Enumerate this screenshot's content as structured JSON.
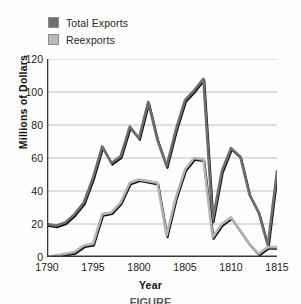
{
  "legend": {
    "position": "top-left",
    "items": [
      {
        "label": "Total Exports",
        "color": "#6e6e6e",
        "key": "total_exports"
      },
      {
        "label": "Reexports",
        "color": "#b3b3b3",
        "key": "reexports"
      }
    ]
  },
  "axes": {
    "ylabel": "Millions of Dollars",
    "xlabel": "Year",
    "yticks": [
      "0",
      "20",
      "40",
      "60",
      "80",
      "100",
      "120"
    ],
    "xticks": [
      "1790",
      "1795",
      "1800",
      "1805",
      "1810",
      "1815"
    ]
  },
  "caption": "FIGURE",
  "chart_data": {
    "type": "line",
    "title": "",
    "xlabel": "Year",
    "ylabel": "Millions of Dollars",
    "xlim": [
      1790,
      1815
    ],
    "ylim": [
      0,
      120
    ],
    "ytick_step": 20,
    "xtick_step": 5,
    "grid": "horizontal",
    "legend_position": "top-left",
    "x": [
      1790,
      1791,
      1792,
      1793,
      1794,
      1795,
      1796,
      1797,
      1798,
      1799,
      1800,
      1801,
      1802,
      1803,
      1804,
      1805,
      1806,
      1807,
      1808,
      1809,
      1810,
      1811,
      1812,
      1813,
      1814,
      1815
    ],
    "series": [
      {
        "name": "Total Exports",
        "color": "#6e6e6e",
        "values": [
          20,
          19,
          21,
          26,
          33,
          48,
          67,
          57,
          61,
          79,
          72,
          94,
          71,
          55,
          77,
          95,
          101,
          108,
          22,
          52,
          66,
          61,
          38,
          27,
          7,
          52
        ]
      },
      {
        "name": "Reexports",
        "color": "#b3b3b3",
        "values": [
          0,
          1,
          2,
          3,
          7,
          8,
          26,
          27,
          33,
          45,
          47,
          46,
          45,
          13,
          36,
          53,
          60,
          59,
          12,
          20,
          24,
          16,
          8,
          2,
          6,
          6
        ]
      }
    ]
  }
}
